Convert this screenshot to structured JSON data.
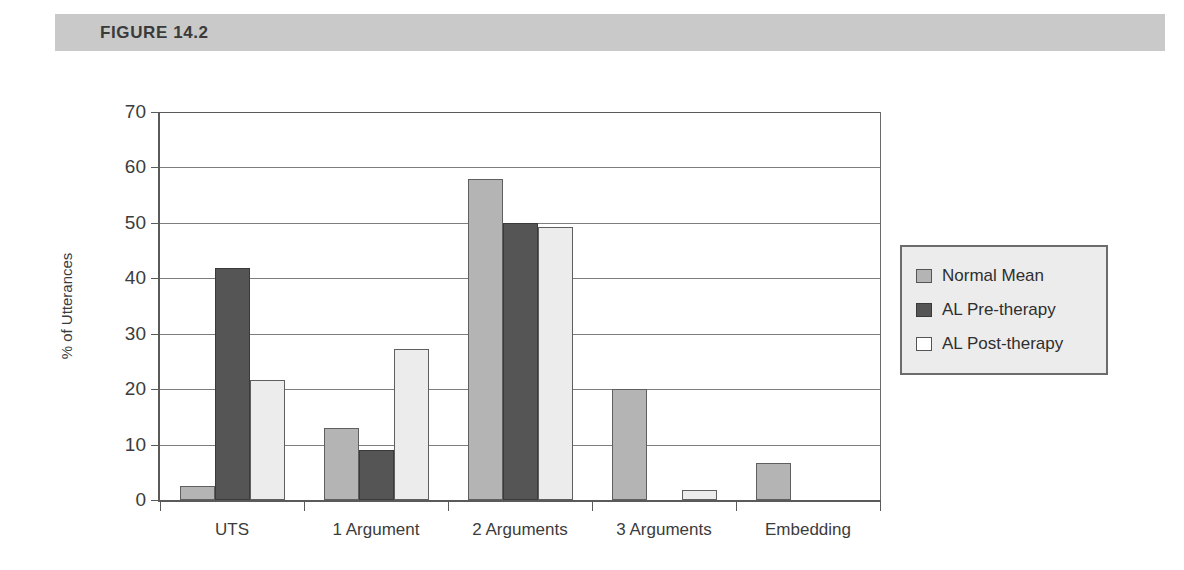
{
  "figure": {
    "header_label": "FIGURE  14.2",
    "header_color": "#c9c9c9"
  },
  "chart_data": {
    "type": "bar",
    "title": "",
    "subtitle": "",
    "xlabel": "",
    "ylabel": "% of Utterances",
    "categories": [
      "UTS",
      "1 Argument",
      "2 Arguments",
      "3 Arguments",
      "Embedding"
    ],
    "series": [
      {
        "name": "Normal Mean",
        "color": "#b4b4b4",
        "values": [
          2.5,
          13.0,
          58.0,
          20.0,
          6.7
        ]
      },
      {
        "name": "AL Pre-therapy",
        "color": "#555555",
        "values": [
          41.8,
          9.0,
          50.0,
          0.0,
          0.0
        ]
      },
      {
        "name": "AL Post-therapy",
        "color": "#ececec",
        "values": [
          21.7,
          27.2,
          49.3,
          1.8,
          0.0
        ]
      }
    ],
    "ylim": [
      0,
      70
    ],
    "yticks": [
      0,
      10,
      20,
      30,
      40,
      50,
      60,
      70
    ],
    "ytick_labels": [
      "0",
      "10",
      "20",
      "30",
      "40",
      "50",
      "60",
      "70"
    ],
    "grid": true,
    "grid_axis": "y",
    "legend_position": "right-outside",
    "legend_entries": [
      "Normal Mean",
      "AL Pre-therapy",
      "AL Post-therapy"
    ]
  }
}
